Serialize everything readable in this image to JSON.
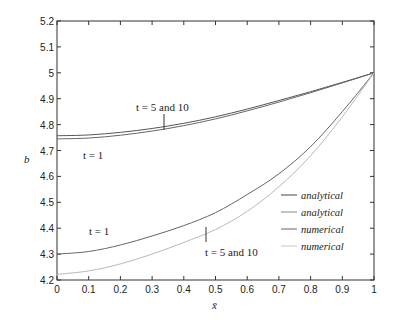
{
  "chart_data": {
    "type": "line",
    "title": "",
    "xlabel": "x̄",
    "ylabel": "b",
    "xlim": [
      0,
      1
    ],
    "ylim": [
      4.2,
      5.2
    ],
    "grid": false,
    "legend_position": "lower right (inside)",
    "xticks": [
      "0",
      "0.1",
      "0.2",
      "0.3",
      "0.4",
      "0.5",
      "0.6",
      "0.7",
      "0.8",
      "0.9",
      "1"
    ],
    "yticks": [
      "4.2",
      "4.3",
      "4.4",
      "4.5",
      "4.6",
      "4.7",
      "4.8",
      "4.9",
      "5",
      "5.1",
      "5.2"
    ],
    "x": [
      0,
      0.1,
      0.2,
      0.3,
      0.4,
      0.5,
      0.6,
      0.7,
      0.8,
      0.9,
      1.0
    ],
    "series": [
      {
        "name": "analytical",
        "group": "upper",
        "label": "t = 5 and 10",
        "color": "#555555",
        "values": [
          4.757,
          4.76,
          4.77,
          4.785,
          4.805,
          4.83,
          4.86,
          4.893,
          4.927,
          4.963,
          5.0
        ]
      },
      {
        "name": "analytical",
        "group": "upper",
        "label": "t = 1",
        "color": "#666666",
        "values": [
          4.745,
          4.748,
          4.759,
          4.775,
          4.796,
          4.822,
          4.853,
          4.887,
          4.923,
          4.961,
          5.0
        ]
      },
      {
        "name": "numerical",
        "group": "lower",
        "label": "t = 1",
        "color": "#666666",
        "values": [
          4.3,
          4.31,
          4.335,
          4.37,
          4.41,
          4.46,
          4.53,
          4.61,
          4.715,
          4.85,
          5.0
        ]
      },
      {
        "name": "numerical",
        "group": "lower",
        "label": "t = 5 and 10",
        "color": "#b8b8b8",
        "values": [
          4.222,
          4.235,
          4.262,
          4.3,
          4.345,
          4.395,
          4.465,
          4.56,
          4.68,
          4.83,
          5.0
        ]
      }
    ],
    "annotations": [
      {
        "text": "t = 5 and 10",
        "x": 0.3,
        "y": 4.83,
        "pointer": "upper curves near x=0.34"
      },
      {
        "text": "t = 1",
        "x": 0.05,
        "y": 4.72
      },
      {
        "text": "t = 1",
        "x": 0.1,
        "y": 4.31
      },
      {
        "text": "t = 5 and 10",
        "x": 0.47,
        "y": 4.22,
        "pointer": "lower curves near x=0.47"
      }
    ]
  },
  "labels": {
    "xlabel": "x̄",
    "ylabel": "b",
    "ann_upper_t5": "t = 5 and 10",
    "ann_upper_t1": "t = 1",
    "ann_lower_t1": "t = 1",
    "ann_lower_t5": "t = 5 and 10"
  },
  "legend": [
    {
      "label": "analytical",
      "color": "#444444"
    },
    {
      "label": "analytical",
      "color": "#888888"
    },
    {
      "label": "numerical",
      "color": "#666666"
    },
    {
      "label": "numerical",
      "color": "#c4c4c4"
    }
  ]
}
